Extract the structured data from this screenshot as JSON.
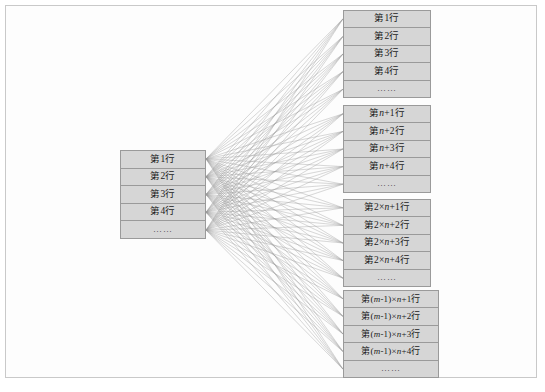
{
  "diagram": {
    "colors": {
      "block_fill": "#d6d6d6",
      "block_border": "#9a9a9a",
      "wire": "#9b9b9b",
      "frame_border": "#c9c9c9",
      "text": "#1a1a1a"
    },
    "ellipsis": "……",
    "source_block": {
      "name": "source-rows",
      "rows": [
        {
          "text": "第1行"
        },
        {
          "text": "第2行"
        },
        {
          "text": "第3行"
        },
        {
          "text": "第4行"
        },
        {
          "text": "……"
        }
      ]
    },
    "target_blocks": [
      {
        "name": "target-block-1",
        "rows": [
          {
            "text": "第1行"
          },
          {
            "text": "第2行"
          },
          {
            "text": "第3行"
          },
          {
            "text": "第4行"
          },
          {
            "text": "……"
          }
        ]
      },
      {
        "name": "target-block-2",
        "rows": [
          {
            "prefix": "第",
            "var": "n",
            "suffix": "+1行",
            "text": "第n+1行"
          },
          {
            "prefix": "第",
            "var": "n",
            "suffix": "+2行",
            "text": "第n+2行"
          },
          {
            "prefix": "第",
            "var": "n",
            "suffix": "+3行",
            "text": "第n+3行"
          },
          {
            "prefix": "第",
            "var": "n",
            "suffix": "+4行",
            "text": "第n+4行"
          },
          {
            "text": "……"
          }
        ]
      },
      {
        "name": "target-block-3",
        "rows": [
          {
            "prefix": "第2×",
            "var": "n",
            "suffix": "+1行",
            "text": "第2×n+1行"
          },
          {
            "prefix": "第2×",
            "var": "n",
            "suffix": "+2行",
            "text": "第2×n+2行"
          },
          {
            "prefix": "第2×",
            "var": "n",
            "suffix": "+3行",
            "text": "第2×n+3行"
          },
          {
            "prefix": "第2×",
            "var": "n",
            "suffix": "+4行",
            "text": "第2×n+4行"
          },
          {
            "text": "……"
          }
        ]
      },
      {
        "name": "target-block-4",
        "rows": [
          {
            "prefix": "第(",
            "var": "m",
            "mid": "-1)×",
            "var2": "n",
            "suffix": "+1行",
            "text": "第(m-1)×n+1行"
          },
          {
            "prefix": "第(",
            "var": "m",
            "mid": "-1)×",
            "var2": "n",
            "suffix": "+2行",
            "text": "第(m-1)×n+2行"
          },
          {
            "prefix": "第(",
            "var": "m",
            "mid": "-1)×",
            "var2": "n",
            "suffix": "+3行",
            "text": "第(m-1)×n+3行"
          },
          {
            "prefix": "第(",
            "var": "m",
            "mid": "-1)×",
            "var2": "n",
            "suffix": "+4行",
            "text": "第(m-1)×n+4行"
          },
          {
            "text": "……"
          }
        ]
      }
    ]
  }
}
